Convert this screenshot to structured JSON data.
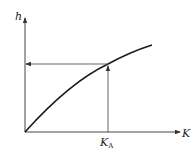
{
  "diagram": {
    "y_axis_label": "h",
    "x_axis_label": "K",
    "x_marker_label_main": "K",
    "x_marker_label_sub": "A",
    "colors": {
      "line": "#333333",
      "curve": "#1a1a1a",
      "background": "#ffffff"
    }
  }
}
